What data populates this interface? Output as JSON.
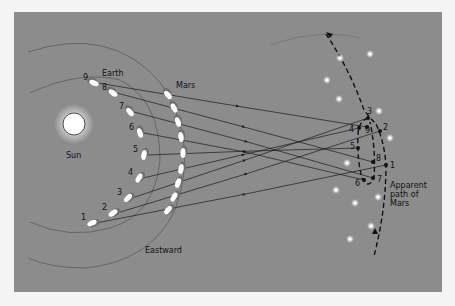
{
  "diagram": {
    "labels": {
      "earth": "Earth",
      "mars": "Mars",
      "sun": "Sun",
      "direction": "Eastward",
      "apparent_path": [
        "Apparent",
        "path of",
        "Mars"
      ]
    },
    "colors": {
      "background": "#8c8c8c",
      "page": "#f4f4f4",
      "lines": "#1a1a1a",
      "planet": "#ffffff",
      "sun": "#ffffff"
    },
    "sun": {
      "x": 74,
      "y": 124,
      "r": 11
    },
    "earth_positions": [
      {
        "n": "1",
        "x": 92,
        "y": 223
      },
      {
        "n": "2",
        "x": 113,
        "y": 213
      },
      {
        "n": "3",
        "x": 128,
        "y": 198
      },
      {
        "n": "4",
        "x": 139,
        "y": 178
      },
      {
        "n": "5",
        "x": 144,
        "y": 155
      },
      {
        "n": "6",
        "x": 140,
        "y": 133
      },
      {
        "n": "7",
        "x": 130,
        "y": 112
      },
      {
        "n": "8",
        "x": 113,
        "y": 93
      },
      {
        "n": "9",
        "x": 94,
        "y": 83
      }
    ],
    "mars_positions": [
      {
        "n": "1",
        "x": 168,
        "y": 210
      },
      {
        "n": "2",
        "x": 174,
        "y": 197
      },
      {
        "n": "3",
        "x": 178,
        "y": 183
      },
      {
        "n": "4",
        "x": 181,
        "y": 169
      },
      {
        "n": "5",
        "x": 183,
        "y": 153
      },
      {
        "n": "6",
        "x": 181,
        "y": 137
      },
      {
        "n": "7",
        "x": 178,
        "y": 122
      },
      {
        "n": "8",
        "x": 174,
        "y": 108
      },
      {
        "n": "9",
        "x": 168,
        "y": 95
      }
    ],
    "apparent_positions": [
      {
        "n": "1",
        "x": 386,
        "y": 165
      },
      {
        "n": "2",
        "x": 380,
        "y": 131
      },
      {
        "n": "3",
        "x": 368,
        "y": 118
      },
      {
        "n": "4",
        "x": 359,
        "y": 128
      },
      {
        "n": "5",
        "x": 358,
        "y": 148
      },
      {
        "n": "6",
        "x": 364,
        "y": 180
      },
      {
        "n": "7",
        "x": 373,
        "y": 178
      },
      {
        "n": "8",
        "x": 373,
        "y": 162
      },
      {
        "n": "9",
        "x": 367,
        "y": 127
      }
    ],
    "stars": [
      {
        "x": 340,
        "y": 58
      },
      {
        "x": 370,
        "y": 54
      },
      {
        "x": 327,
        "y": 80
      },
      {
        "x": 339,
        "y": 99
      },
      {
        "x": 379,
        "y": 111
      },
      {
        "x": 390,
        "y": 138
      },
      {
        "x": 347,
        "y": 163
      },
      {
        "x": 336,
        "y": 190
      },
      {
        "x": 355,
        "y": 203
      },
      {
        "x": 378,
        "y": 197
      },
      {
        "x": 371,
        "y": 226
      },
      {
        "x": 350,
        "y": 239
      }
    ]
  }
}
